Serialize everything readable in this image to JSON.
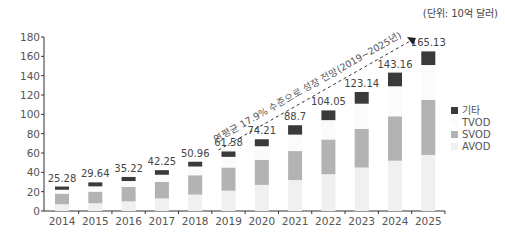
{
  "unit_label": "(단위: 10억 달러)",
  "annotation": "연평균 17.9% 수준으로 성장 전망(2019~2025년)",
  "colors": {
    "AVOD": "#f0f0f0",
    "SVOD": "#b3b3b3",
    "TVOD": "#fbfbfb",
    "기타": "#3a3a3a",
    "axis": "#333333",
    "text": "#555555"
  },
  "chart_data": {
    "type": "bar",
    "stacked": true,
    "title": "",
    "unit": "(단위: 10억 달러)",
    "xlabel": "",
    "ylabel": "",
    "ylim": [
      0,
      180
    ],
    "yticks": [
      0,
      20,
      40,
      60,
      80,
      100,
      120,
      140,
      160,
      180
    ],
    "grid": false,
    "legend_position": "right",
    "categories": [
      "2014",
      "2015",
      "2016",
      "2017",
      "2018",
      "2019",
      "2020",
      "2021",
      "2022",
      "2023",
      "2024",
      "2025"
    ],
    "series": [
      {
        "name": "AVOD",
        "values": [
          7,
          8,
          10,
          13,
          17,
          21,
          27,
          32,
          38,
          45,
          52,
          58
        ]
      },
      {
        "name": "SVOD",
        "values": [
          11,
          12,
          15,
          17,
          20,
          24,
          26,
          30,
          36,
          40,
          46,
          57
        ]
      },
      {
        "name": "TVOD",
        "values": [
          4,
          5.5,
          6,
          7.5,
          9,
          11,
          14,
          17,
          20,
          26,
          31,
          36
        ]
      },
      {
        "name": "기타",
        "values": [
          3.28,
          4.14,
          4.22,
          4.75,
          4.96,
          5.58,
          7.21,
          9.7,
          10.05,
          12.14,
          14.16,
          14.13
        ]
      }
    ],
    "totals": [
      25.28,
      29.64,
      35.22,
      42.25,
      50.96,
      61.58,
      74.21,
      88.7,
      104.05,
      123.14,
      143.16,
      165.13
    ],
    "total_labels": [
      "25.28",
      "29.64",
      "35.22",
      "42.25",
      "50.96",
      "61.58",
      "74.21",
      "88.7",
      "104.05",
      "123.14",
      "143.16",
      "165.13"
    ],
    "legend": [
      "기타",
      "TVOD",
      "SVOD",
      "AVOD"
    ],
    "annotations": [
      {
        "text": "연평균 17.9% 수준으로 성장 전망(2019~2025년)",
        "type": "dashed-arrow",
        "from": "2019",
        "to": "2025"
      }
    ]
  }
}
